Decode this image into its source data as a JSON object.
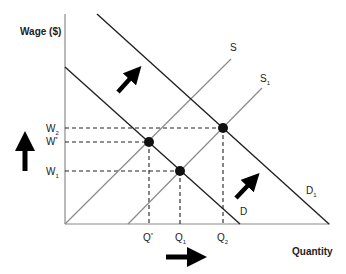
{
  "diagram": {
    "y_axis_title": "Wage ($)",
    "x_axis_title": "Quantity",
    "curves": {
      "supply": {
        "label": "S",
        "sub": ""
      },
      "supply_shifted": {
        "label": "S",
        "sub": "1"
      },
      "demand": {
        "label": "D",
        "sub": ""
      },
      "demand_shifted": {
        "label": "D",
        "sub": "1"
      }
    },
    "wage_levels": [
      {
        "label": "W",
        "sub": "2"
      },
      {
        "label": "W",
        "sub": "*"
      },
      {
        "label": "W",
        "sub": "1"
      }
    ],
    "quantity_levels": [
      {
        "label": "Q",
        "sub": "*"
      },
      {
        "label": "Q",
        "sub": "1"
      },
      {
        "label": "Q",
        "sub": "2"
      }
    ],
    "equilibria": [
      {
        "name": "original",
        "wage": "W*",
        "quantity": "Q*"
      },
      {
        "name": "supply-shift",
        "wage": "W1",
        "quantity": "Q1"
      },
      {
        "name": "demand-shift",
        "wage": "W2",
        "quantity": "Q2"
      }
    ],
    "arrows": [
      {
        "name": "demand-shift-arrow-upper",
        "direction": "up-right"
      },
      {
        "name": "demand-shift-arrow-lower",
        "direction": "up-right"
      },
      {
        "name": "wage-increase-arrow",
        "direction": "up"
      },
      {
        "name": "quantity-increase-arrow",
        "direction": "right"
      }
    ],
    "colors": {
      "demand_line": "#222222",
      "supply_line": "#8a8a8a",
      "axis": "#8a8a8a",
      "points": "#111111",
      "arrows": "#000000"
    }
  }
}
